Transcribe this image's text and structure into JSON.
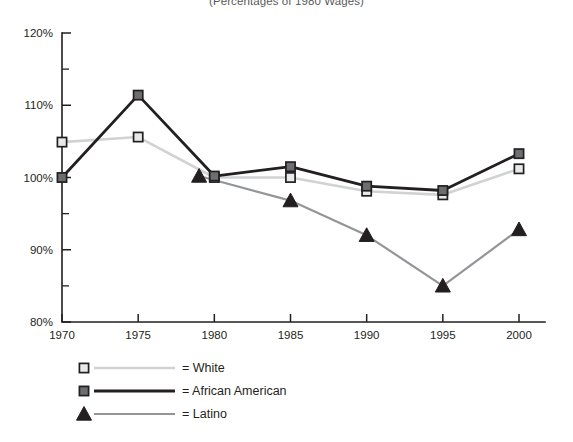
{
  "subtitle": "(Percentages of 1980 Wages)",
  "chart_data": {
    "type": "line",
    "title": "",
    "subtitle": "(Percentages of 1980 Wages)",
    "xlabel": "",
    "ylabel": "",
    "xlim": [
      1968.5,
      2001.5
    ],
    "ylim": [
      80,
      120
    ],
    "x_ticks": [
      1970,
      1975,
      1980,
      1985,
      1990,
      1995,
      2000
    ],
    "x_tick_labels": [
      "1970",
      "1975",
      "1980",
      "1985",
      "1990",
      "1995",
      "2000"
    ],
    "y_ticks": [
      80,
      85,
      90,
      95,
      100,
      105,
      110,
      115,
      120
    ],
    "y_major_ticks": [
      80,
      90,
      100,
      110,
      120
    ],
    "y_tick_labels": [
      "80%",
      "90%",
      "100%",
      "110%",
      "120%"
    ],
    "grid": false,
    "legend_position": "bottom",
    "series": [
      {
        "name": "White",
        "color": "#d0d2d3",
        "marker": "square-open",
        "marker_fill": "#e8e9ea",
        "marker_edge": "#231f20",
        "x": [
          1970,
          1975,
          1980,
          1985,
          1990,
          1995,
          2000
        ],
        "values": [
          104.9,
          105.6,
          100.0,
          100.0,
          98.1,
          97.6,
          101.2
        ]
      },
      {
        "name": "African American",
        "color": "#231f20",
        "marker": "square-filled",
        "marker_fill": "#6d6e71",
        "marker_edge": "#231f20",
        "x": [
          1970,
          1975,
          1980,
          1985,
          1990,
          1995,
          2000
        ],
        "values": [
          100.0,
          111.4,
          100.2,
          101.5,
          98.8,
          98.2,
          103.3
        ]
      },
      {
        "name": "Latino",
        "color": "#939598",
        "marker": "triangle-filled",
        "marker_fill": "#231f20",
        "marker_edge": "#231f20",
        "x": [
          1979,
          1985,
          1990,
          1995,
          2000
        ],
        "values": [
          100.2,
          96.8,
          92.0,
          85.0,
          92.8
        ]
      }
    ]
  },
  "legend": {
    "items": [
      {
        "label": "= White",
        "name": "White"
      },
      {
        "label": "= African American",
        "name": "African American"
      },
      {
        "label": "= Latino",
        "name": "Latino"
      }
    ]
  }
}
